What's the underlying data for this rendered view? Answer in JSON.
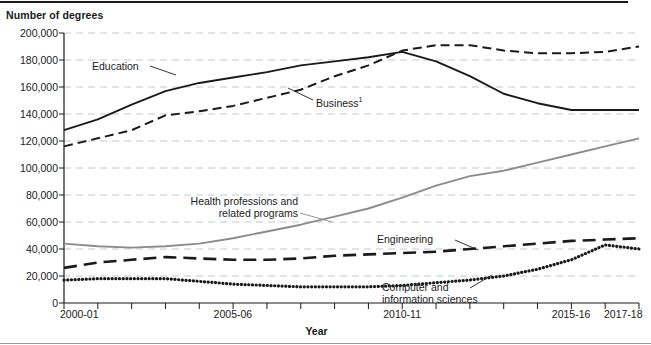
{
  "chart_data": {
    "type": "line",
    "title": "",
    "ylabel": "Number of degrees",
    "xlabel": "Year",
    "ylim": [
      0,
      200000
    ],
    "ytick_labels": [
      "200,000",
      "180,000",
      "160,000",
      "140,000",
      "120,000",
      "100,000",
      "80,000",
      "60,000",
      "40,000",
      "20,000",
      "0"
    ],
    "ytick_values": [
      200000,
      180000,
      160000,
      140000,
      120000,
      100000,
      80000,
      60000,
      40000,
      20000,
      0
    ],
    "grid": true,
    "legend_position": "inline-annotations",
    "x": [
      "2000-01",
      "2001-02",
      "2002-03",
      "2003-04",
      "2004-05",
      "2005-06",
      "2006-07",
      "2007-08",
      "2008-09",
      "2009-10",
      "2010-11",
      "2011-12",
      "2012-13",
      "2013-14",
      "2014-15",
      "2015-16",
      "2016-17",
      "2017-18"
    ],
    "xtick_labels": [
      "2000-01",
      "2005-06",
      "2010-11",
      "2015-16",
      "2017-18"
    ],
    "xtick_indices": [
      0,
      5,
      10,
      15,
      17
    ],
    "series": [
      {
        "name": "Education",
        "style": "solid",
        "color": "#1a1a1a",
        "values": [
          128000,
          136000,
          147000,
          157000,
          163000,
          167000,
          171000,
          176000,
          179000,
          182000,
          186000,
          179000,
          168000,
          155000,
          148000,
          143000,
          143000,
          143000
        ]
      },
      {
        "name": "Business",
        "style": "dashed",
        "color": "#1a1a1a",
        "values": [
          116000,
          122000,
          128000,
          139000,
          142000,
          146000,
          152000,
          158000,
          168000,
          176000,
          187000,
          191000,
          191000,
          187000,
          185000,
          185000,
          186000,
          190000
        ]
      },
      {
        "name": "Health professions and related programs",
        "style": "solid",
        "color": "#8c8c8c",
        "values": [
          44000,
          42000,
          41000,
          42000,
          44000,
          48000,
          53000,
          58000,
          64000,
          70000,
          78000,
          87000,
          94000,
          98000,
          104000,
          110000,
          116000,
          122000
        ]
      },
      {
        "name": "Engineering",
        "style": "long-dashed",
        "color": "#1a1a1a",
        "values": [
          26000,
          30000,
          32000,
          34000,
          33000,
          32000,
          32000,
          33000,
          35000,
          36000,
          37000,
          38000,
          40000,
          42000,
          44000,
          46000,
          47000,
          48000
        ]
      },
      {
        "name": "Computer and information sciences",
        "style": "dotted",
        "color": "#1a1a1a",
        "values": [
          17000,
          18000,
          18000,
          18000,
          16000,
          14000,
          13000,
          12000,
          12000,
          12000,
          13000,
          15000,
          17000,
          20000,
          25000,
          32000,
          43000,
          40000
        ]
      }
    ],
    "annotations": [
      {
        "text": "Education",
        "target_series": "Education"
      },
      {
        "text": "Business",
        "superscript": "1",
        "target_series": "Business"
      },
      {
        "text": "Health professions and",
        "text2": "related programs",
        "target_series": "Health professions and related programs"
      },
      {
        "text": "Engineering",
        "target_series": "Engineering"
      },
      {
        "text": "Computer and",
        "text2": "information sciences",
        "target_series": "Computer and information sciences"
      }
    ]
  }
}
